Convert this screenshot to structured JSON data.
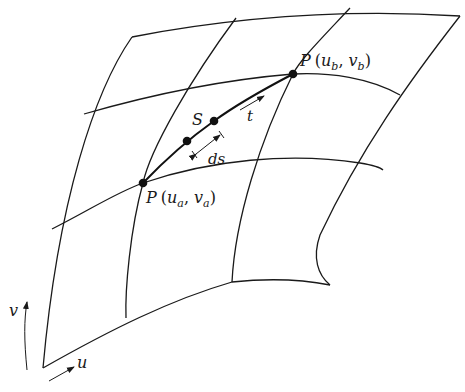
{
  "figure": {
    "colors": {
      "stroke": "#1a1a1a",
      "background": "#ffffff"
    }
  },
  "labels": {
    "point_a": {
      "name": "P",
      "args": "(u",
      "sub1": "a",
      "mid": ", v",
      "sub2": "a",
      "end": ")"
    },
    "point_b": {
      "name": "P",
      "args": "(u",
      "sub1": "b",
      "mid": ", v",
      "sub2": "b",
      "end": ")"
    },
    "curve": "S",
    "tangent": "t",
    "arc_element": "ds",
    "axis_u": "u",
    "axis_v": "v"
  }
}
